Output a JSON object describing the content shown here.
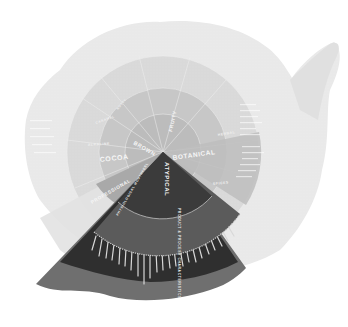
{
  "caption": "",
  "wheel": {
    "center": {
      "x": 163,
      "y": 152
    },
    "highlighted_category": "ATYPICAL",
    "colors": {
      "paper_outer": "#e8e8e8",
      "paper_mid": "#d6d6d6",
      "inner_ring": "#c2c2c2",
      "core": "#b4b4b4",
      "highlight_core": "#3a3a3a",
      "highlight_mid": "#555555",
      "highlight_outer": "#2e2e2e",
      "tail": "#6e6e6e",
      "separator": "#f2f2f2"
    },
    "inner_categories": {
      "brown": "BROWN",
      "cocoa": "COCOA",
      "botanical": "BOTANICAL",
      "atypical": "ATYPICAL",
      "professional": "PROFESSIONAL",
      "top": "FRUITY"
    },
    "middle_categories": {
      "product_process": "PRODUCT & PROCESS CHARACTERISTICS",
      "physiological": "PHYSIOLOGICAL MOUTHFEEL",
      "spices": "SPICES",
      "herbs": "HERBAL",
      "alkaline": "ALKALINE",
      "caramel": "CARAMEL",
      "nutty": "NUTTY"
    }
  }
}
